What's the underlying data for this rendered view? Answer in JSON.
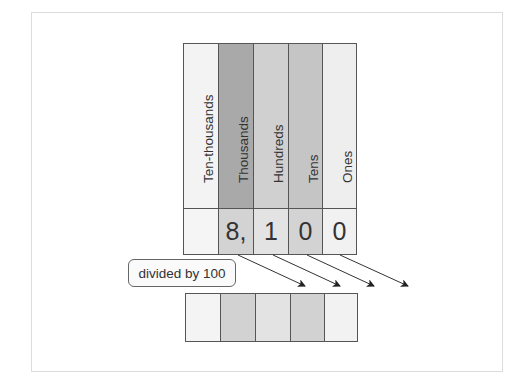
{
  "diagram": {
    "columns": [
      {
        "name": "Ten-thousands",
        "header_color": "#f3f3f3",
        "digit": "",
        "digit_color": "#f5f5f5",
        "result_color": "#f4f4f4"
      },
      {
        "name": "Thousands",
        "header_color": "#a9a9a9",
        "digit": "8,",
        "digit_color": "#d3d3d3",
        "result_color": "#d2d2d2"
      },
      {
        "name": "Hundreds",
        "header_color": "#d0d0d0",
        "digit": "1",
        "digit_color": "#e3e3e3",
        "result_color": "#e3e3e3"
      },
      {
        "name": "Tens",
        "header_color": "#c5c5c5",
        "digit": "0",
        "digit_color": "#d3d3d3",
        "result_color": "#d2d2d2"
      },
      {
        "name": "Ones",
        "header_color": "#eeeeee",
        "digit": "0",
        "digit_color": "#f1f1f1",
        "result_color": "#f2f2f2"
      }
    ],
    "operation_label": "divided by 100",
    "number": "8,100",
    "arrow_count": 4
  }
}
